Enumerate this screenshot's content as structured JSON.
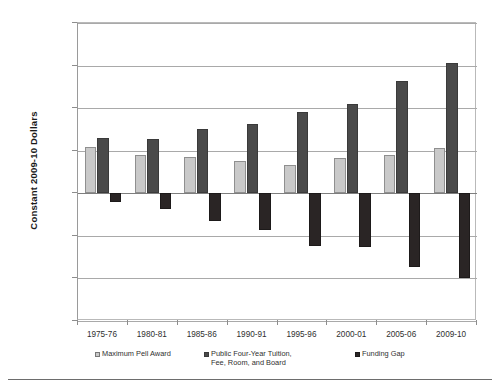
{
  "chart_data": {
    "type": "bar",
    "title": "",
    "subtitle": "",
    "xlabel": "",
    "ylabel": "Constant 2009-10 Dollars",
    "categories": [
      "1975-76",
      "1980-81",
      "1985-86",
      "1990-91",
      "1995-96",
      "2000-01",
      "2005-06",
      "2009-10"
    ],
    "series": [
      {
        "name": "Maximum Pell Award",
        "color": "#c9c9c9",
        "values": [
          5400,
          4450,
          4250,
          3800,
          3350,
          4200,
          4500,
          5300
        ]
      },
      {
        "name": "Public Four-Year Tuition, Fee, Room, and Board",
        "color": "#4a4a4a",
        "values": [
          6450,
          6350,
          7550,
          8100,
          9500,
          10500,
          13200,
          15300
        ]
      },
      {
        "name": "Funding Gap",
        "color": "#2a2525",
        "values": [
          -1050,
          -1900,
          -3300,
          -4300,
          -6150,
          -6300,
          -8700,
          -10000
        ]
      }
    ],
    "ylim": [
      -15000,
      20000
    ],
    "ytick_values": [
      20000,
      15000,
      10000,
      5000,
      0,
      -5000,
      -10000,
      -15000
    ],
    "ytick_labels": [
      "$20,000",
      "$15,000",
      "$10,000",
      "$5,000",
      "$0",
      "($5,000)",
      "($10,000)",
      "($15,000)"
    ],
    "grid": true,
    "legend_position": "bottom",
    "legend": [
      {
        "label": "Maximum Pell Award",
        "swatch": "pell"
      },
      {
        "label": "Public Four-Year Tuition,\nFee, Room, and Board",
        "swatch": "tuition"
      },
      {
        "label": "Funding Gap",
        "swatch": "gap"
      }
    ]
  }
}
